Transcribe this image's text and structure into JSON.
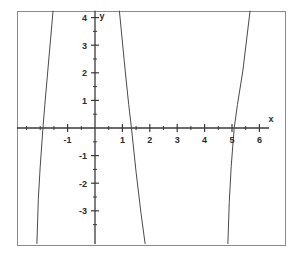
{
  "figure": {
    "name": "cartesian-plot",
    "background_color": "#ffffff",
    "frame_color": "#8a8a8a",
    "axis_color": "#3a3a3a",
    "curve_color": "#4a4a4a",
    "frame": {
      "x": 17,
      "y": 11,
      "width": 268,
      "height": 234
    }
  },
  "chart_data": {
    "type": "line",
    "title": "",
    "subtitle": "",
    "xlabel": "x",
    "ylabel": "y",
    "xlim": [
      -2.85,
      6.35
    ],
    "ylim": [
      -4.2,
      4.25
    ],
    "grid": false,
    "legend": false,
    "legend_position": "none",
    "axes_style": "centered-cartesian",
    "x_ticks_major": [
      -1,
      1,
      2,
      3,
      4,
      5,
      6
    ],
    "x_tick_labels": [
      "-1",
      "1",
      "2",
      "3",
      "4",
      "5",
      "6"
    ],
    "x_ticks_minor": [
      -2.5,
      -2,
      -1.5,
      -0.5,
      0.5,
      1.5,
      2.5,
      3.5,
      4.5,
      5.5
    ],
    "y_ticks_major": [
      -3,
      -2,
      -1,
      1,
      2,
      3,
      4
    ],
    "y_tick_labels": [
      "-3",
      "-2",
      "-1",
      "1",
      "2",
      "3",
      "4"
    ],
    "y_ticks_minor": [
      -3.5,
      -2.5,
      -1.5,
      -0.5,
      0.5,
      1.5,
      2.5,
      3.5
    ],
    "origin_label": "",
    "series": [
      {
        "name": "left-branch",
        "color": "#4a4a4a",
        "x_intercept": -1.9,
        "points": [
          [
            -1.53,
            4.25
          ],
          [
            -1.72,
            2.1
          ],
          [
            -1.83,
            0.85
          ],
          [
            -1.9,
            0.0
          ],
          [
            -2.0,
            -1.4
          ],
          [
            -2.07,
            -2.6
          ],
          [
            -2.12,
            -4.2
          ]
        ]
      },
      {
        "name": "middle-branch",
        "color": "#4a4a4a",
        "x_intercept": 1.33,
        "points": [
          [
            0.89,
            4.25
          ],
          [
            1.1,
            2.1
          ],
          [
            1.23,
            0.85
          ],
          [
            1.33,
            0.0
          ],
          [
            1.5,
            -1.6
          ],
          [
            1.68,
            -3.1
          ],
          [
            1.83,
            -4.2
          ]
        ]
      },
      {
        "name": "right-branch",
        "color": "#4a4a4a",
        "x_intercept": 5.08,
        "points": [
          [
            5.66,
            4.25
          ],
          [
            5.4,
            2.1
          ],
          [
            5.2,
            0.85
          ],
          [
            5.08,
            0.0
          ],
          [
            4.97,
            -1.4
          ],
          [
            4.9,
            -2.7
          ],
          [
            4.85,
            -4.2
          ]
        ]
      }
    ]
  }
}
